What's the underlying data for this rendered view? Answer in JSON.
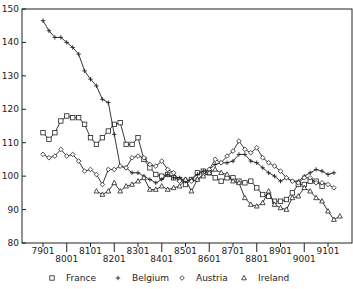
{
  "chart_data": {
    "type": "line",
    "title": "",
    "xlabel": "",
    "ylabel": "",
    "ylim": [
      80,
      150
    ],
    "yticks": [
      80,
      90,
      100,
      110,
      120,
      130,
      140,
      150
    ],
    "xticks_upper": [
      "7901",
      "8101",
      "8301",
      "8501",
      "8701",
      "8901",
      "9101"
    ],
    "xticks_lower": [
      "8001",
      "8201",
      "8401",
      "8601",
      "8801",
      "9001"
    ],
    "grid": false,
    "legend_position": "bottom",
    "x_start": "7901",
    "x_step": "quarterly",
    "series": [
      {
        "name": "France",
        "marker": "square",
        "start_index": 0,
        "values": [
          113,
          111,
          113,
          116.5,
          118,
          117.5,
          117.5,
          115.5,
          111.5,
          109.5,
          111.5,
          113.5,
          115.5,
          116,
          109.5,
          109.5,
          111.5,
          105,
          102.5,
          100.5,
          100,
          100.5,
          99.5,
          99,
          97.5,
          99,
          101,
          101.5,
          101,
          99.5,
          98.5,
          99.5,
          99.5,
          98.5,
          98,
          98.5,
          96.5,
          94.5,
          94,
          92.5,
          92.5,
          93,
          95,
          97.5,
          97.5,
          98.5,
          98.5,
          97
        ]
      },
      {
        "name": "Belgium",
        "marker": "plus",
        "start_index": 0,
        "values": [
          146.5,
          143.5,
          141.5,
          141.5,
          140,
          138.5,
          136.5,
          131.5,
          129,
          127,
          123,
          122,
          112.5,
          103,
          102.5,
          101,
          101,
          100,
          99,
          98,
          99,
          100.5,
          99.5,
          99.5,
          98.5,
          99,
          100.5,
          101.5,
          102,
          103.5,
          104,
          104,
          104.5,
          106.5,
          106.5,
          104.5,
          104,
          102.5,
          101,
          100,
          98.5,
          99.5,
          98.5,
          98.5,
          100,
          101,
          102,
          101.5,
          100.5,
          101
        ]
      },
      {
        "name": "Austria",
        "marker": "diamond",
        "start_index": 0,
        "values": [
          106.5,
          105.5,
          106,
          108,
          106,
          106.5,
          104.5,
          101.5,
          102,
          100.5,
          97.5,
          102,
          102,
          103,
          102.5,
          105.5,
          106,
          105.5,
          103.5,
          103,
          104.5,
          102,
          101,
          98.5,
          99,
          98.5,
          99,
          100.5,
          102,
          105,
          104,
          106,
          107.5,
          110.5,
          108,
          107,
          108.5,
          105.5,
          104,
          103,
          101.5,
          99.5,
          98.5,
          98,
          99.5,
          99.5,
          98,
          98,
          97.5,
          96.5
        ]
      },
      {
        "name": "Ireland",
        "marker": "triangle",
        "start_index": 9,
        "values": [
          95.5,
          94.5,
          95.5,
          98,
          95.5,
          97,
          97.5,
          98.5,
          99.5,
          96,
          96,
          97,
          96,
          96.5,
          97,
          99,
          95.5,
          99,
          100,
          101,
          102,
          101,
          100.5,
          98.5,
          98,
          93.5,
          91.5,
          91,
          92,
          95.5,
          91.5,
          90.5,
          90,
          93.5,
          94,
          96.5,
          95.5,
          93.5,
          92.5,
          89.5,
          87,
          88
        ]
      }
    ]
  },
  "legend": {
    "items": [
      {
        "symbol": "□",
        "label": "France"
      },
      {
        "symbol": "+",
        "label": "Belgium"
      },
      {
        "symbol": "◇",
        "label": "Austria"
      },
      {
        "symbol": "△",
        "label": "Ireland"
      }
    ]
  }
}
